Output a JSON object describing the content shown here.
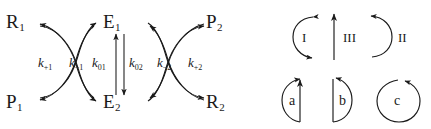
{
  "figure": {
    "panels": [
      "kinetic-scheme",
      "arrow-legend"
    ]
  },
  "scheme": {
    "species": {
      "top_left": {
        "label": "R",
        "sub": "1"
      },
      "bottom_left": {
        "label": "P",
        "sub": "1"
      },
      "top_center": {
        "label": "E",
        "sub": "1"
      },
      "bottom_center": {
        "label": "E",
        "sub": "2"
      },
      "top_right": {
        "label": "P",
        "sub": "2"
      },
      "bottom_right": {
        "label": "R",
        "sub": "2"
      }
    },
    "rate_constants": [
      {
        "id": "k-plus-1",
        "symbol": "k",
        "sub": "+1"
      },
      {
        "id": "k-minus-1",
        "symbol": "k",
        "sub": "−1"
      },
      {
        "id": "k-0-1",
        "symbol": "k",
        "sub": "01"
      },
      {
        "id": "k-0-2",
        "symbol": "k",
        "sub": "02"
      },
      {
        "id": "k-minus-2",
        "symbol": "k",
        "sub": "−2"
      },
      {
        "id": "k-plus-2",
        "symbol": "k",
        "sub": "+2"
      }
    ]
  },
  "legend": {
    "top_row": [
      {
        "id": "arc-I",
        "label": "I"
      },
      {
        "id": "arc-III",
        "label": "III"
      },
      {
        "id": "arc-II",
        "label": "II"
      }
    ],
    "bottom_row": [
      {
        "id": "arc-a",
        "label": "a"
      },
      {
        "id": "arc-b",
        "label": "b"
      },
      {
        "id": "arc-c",
        "label": "c"
      }
    ]
  },
  "colors": {
    "stroke": "#1a1a1a",
    "background": "#ffffff"
  }
}
